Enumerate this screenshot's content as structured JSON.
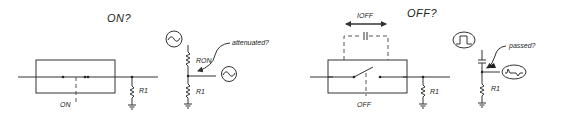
{
  "on_panel": {
    "title": "ON?",
    "switch_state_label": "ON",
    "load_resistor_label": "R1",
    "equivalent": {
      "series_resistor_label": "RON",
      "shunt_resistor_label": "R1",
      "annotation": "attenuated?",
      "source_icon": "sine-wave-icon",
      "output_icon": "sine-wave-icon"
    }
  },
  "off_panel": {
    "title": "OFF?",
    "leakage_label": "IOFF",
    "switch_state_label": "OFF",
    "load_resistor_label": "R1",
    "equivalent": {
      "shunt_resistor_label": "R1",
      "annotation": "passed?",
      "source_icon": "square-pulse-icon",
      "output_icon": "spike-wave-icon"
    }
  }
}
